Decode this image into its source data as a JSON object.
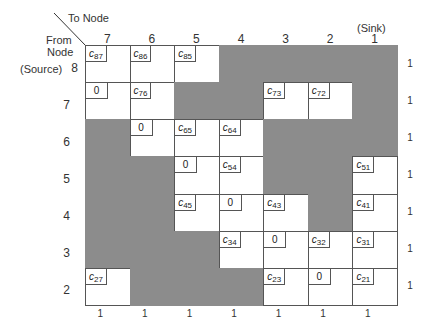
{
  "labels": {
    "to_node": "To Node",
    "from_node_line1": "From",
    "from_node_line2": "Node",
    "source": "(Source)",
    "sink": "(Sink)"
  },
  "columns": [
    "7",
    "6",
    "5",
    "4",
    "3",
    "2",
    "1"
  ],
  "rows": [
    "8",
    "7",
    "6",
    "5",
    "4",
    "3",
    "2"
  ],
  "matrix": [
    [
      {
        "t": "c",
        "s": "87"
      },
      {
        "t": "c",
        "s": "86"
      },
      {
        "t": "c",
        "s": "85"
      },
      {
        "t": "g"
      },
      {
        "t": "g"
      },
      {
        "t": "g"
      },
      {
        "t": "g"
      }
    ],
    [
      {
        "t": "z",
        "v": "0"
      },
      {
        "t": "c",
        "s": "76"
      },
      {
        "t": "g"
      },
      {
        "t": "g"
      },
      {
        "t": "c",
        "s": "73"
      },
      {
        "t": "c",
        "s": "72"
      },
      {
        "t": "g"
      }
    ],
    [
      {
        "t": "g"
      },
      {
        "t": "z",
        "v": "0"
      },
      {
        "t": "c",
        "s": "65"
      },
      {
        "t": "c",
        "s": "64"
      },
      {
        "t": "g"
      },
      {
        "t": "g"
      },
      {
        "t": "g"
      }
    ],
    [
      {
        "t": "g"
      },
      {
        "t": "g"
      },
      {
        "t": "z",
        "v": "0"
      },
      {
        "t": "c",
        "s": "54"
      },
      {
        "t": "g"
      },
      {
        "t": "g"
      },
      {
        "t": "c",
        "s": "51"
      }
    ],
    [
      {
        "t": "g"
      },
      {
        "t": "g"
      },
      {
        "t": "c",
        "s": "45"
      },
      {
        "t": "z",
        "v": "0"
      },
      {
        "t": "c",
        "s": "43"
      },
      {
        "t": "g"
      },
      {
        "t": "c",
        "s": "41"
      }
    ],
    [
      {
        "t": "g"
      },
      {
        "t": "g"
      },
      {
        "t": "g"
      },
      {
        "t": "c",
        "s": "34"
      },
      {
        "t": "z",
        "v": "0"
      },
      {
        "t": "c",
        "s": "32"
      },
      {
        "t": "c",
        "s": "31"
      }
    ],
    [
      {
        "t": "c",
        "s": "27"
      },
      {
        "t": "g"
      },
      {
        "t": "g"
      },
      {
        "t": "g"
      },
      {
        "t": "c",
        "s": "23"
      },
      {
        "t": "z",
        "v": "0"
      },
      {
        "t": "c",
        "s": "21"
      }
    ]
  ],
  "row_capacities": [
    "1",
    "1",
    "1",
    "1",
    "1",
    "1",
    "1"
  ],
  "column_capacities": [
    "1",
    "1",
    "1",
    "1",
    "1",
    "1",
    "1"
  ],
  "colors": {
    "shaded": "#8c8c8c",
    "cell": "#ffffff",
    "line": "#555555"
  }
}
